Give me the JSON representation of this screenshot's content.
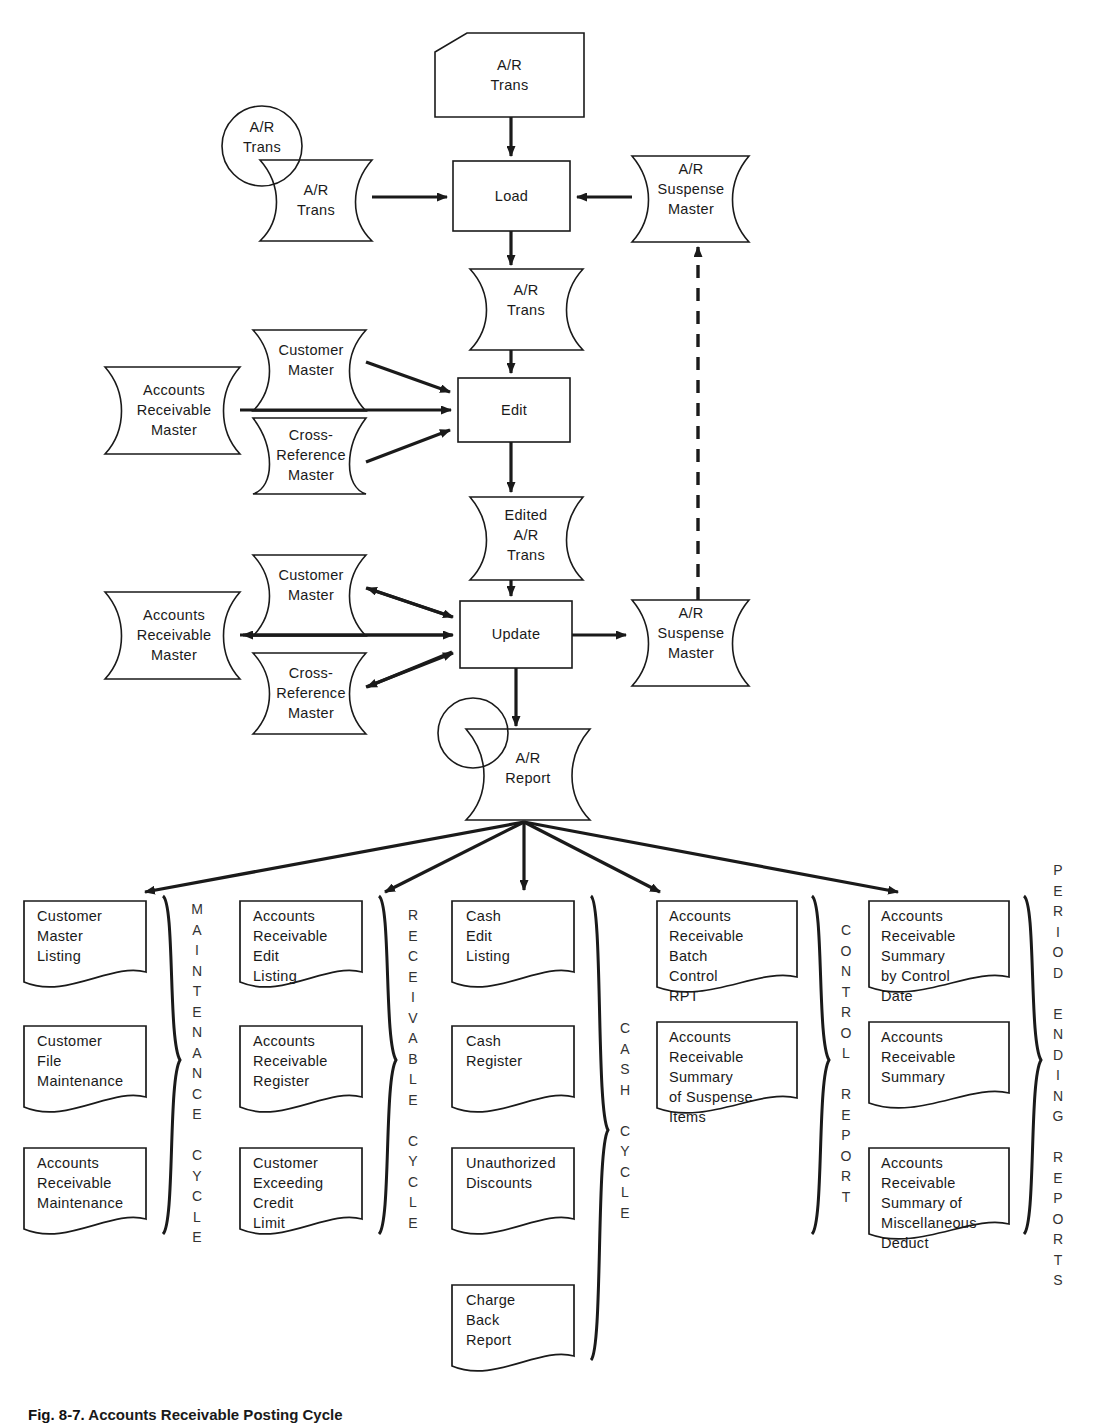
{
  "figure": {
    "caption_number": "Fig. 8-7.",
    "caption_text": "Accounts Receivable Posting Cycle"
  },
  "flow": {
    "punched_card": {
      "label": "A/R\nTrans"
    },
    "tape_circle": {
      "label": "A/R\nTrans"
    },
    "disk_trans": {
      "label": "A/R\nTrans"
    },
    "process_load": {
      "label": "Load"
    },
    "suspense_master_top": {
      "label": "A/R\nSuspense\nMaster"
    },
    "disk_ar_trans_2": {
      "label": "A/R\nTrans"
    },
    "customer_master_edit": {
      "label": "Customer\nMaster"
    },
    "ar_master_edit": {
      "label": "Accounts\nReceivable\nMaster"
    },
    "cross_reference_edit": {
      "label": "Cross-\nReference\nMaster"
    },
    "process_edit": {
      "label": "Edit"
    },
    "edited_ar_trans": {
      "label": "Edited\nA/R\nTrans"
    },
    "customer_master_update": {
      "label": "Customer\nMaster"
    },
    "ar_master_update": {
      "label": "Accounts\nReceivable\nMaster"
    },
    "cross_reference_update": {
      "label": "Cross-\nReference\nMaster"
    },
    "process_update": {
      "label": "Update"
    },
    "suspense_master_bottom": {
      "label": "A/R\nSuspense\nMaster"
    },
    "ar_report": {
      "label": "A/R\nReport"
    }
  },
  "groups": [
    {
      "id": "maintenance-cycle",
      "letters": "M\nA\nI\nN\nT\nE\nN\nA\nN\nC\nE\n \nC\nY\nC\nL\nE",
      "documents": [
        {
          "label": "Customer\nMaster\nListing"
        },
        {
          "label": "Customer\nFile\nMaintenance"
        },
        {
          "label": "Accounts\nReceivable\nMaintenance"
        }
      ]
    },
    {
      "id": "receivable-cycle",
      "letters": "R\nE\nC\nE\nI\nV\nA\nB\nL\nE\n \nC\nY\nC\nL\nE",
      "documents": [
        {
          "label": "Accounts\nReceivable\nEdit\nListing"
        },
        {
          "label": "Accounts\nReceivable\nRegister"
        },
        {
          "label": "Customer\nExceeding\nCredit\nLimit"
        }
      ]
    },
    {
      "id": "cash-cycle",
      "letters": "C\nA\nS\nH\n \nC\nY\nC\nL\nE",
      "documents": [
        {
          "label": "Cash\nEdit\nListing"
        },
        {
          "label": "Cash\nRegister"
        },
        {
          "label": "Unauthorized\nDiscounts"
        },
        {
          "label": "Charge\nBack\nReport"
        }
      ]
    },
    {
      "id": "control-report",
      "letters": "C\nO\nN\nT\nR\nO\nL\n \nR\nE\nP\nO\nR\nT",
      "documents": [
        {
          "label": "Accounts\nReceivable\nBatch\nControl\nRPT"
        },
        {
          "label": "Accounts\nReceivable\nSummary\nof Suspense\nItems"
        }
      ]
    },
    {
      "id": "period-ending-reports",
      "letters": "P\nE\nR\nI\nO\nD\n \nE\nN\nD\nI\nN\nG\n \nR\nE\nP\nO\nR\nT\nS",
      "documents": [
        {
          "label": "Accounts\nReceivable\nSummary\nby Control\nDate"
        },
        {
          "label": "Accounts\nReceivable\nSummary"
        },
        {
          "label": "Accounts\nReceivable\nSummary of\nMiscellaneous\nDeduct"
        }
      ]
    }
  ],
  "colors": {
    "ink": "#1a1a1a",
    "paper": "#ffffff"
  }
}
